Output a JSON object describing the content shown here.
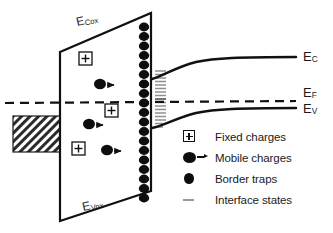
{
  "figure": {
    "kind": "mos-energy-band-diagram",
    "background": "#ffffff",
    "line_color": "#111111",
    "interface_state_color": "#8f8f8f"
  },
  "oxide": {
    "top_band_label": "E",
    "top_band_sub": "Cox",
    "bottom_band_label": "E",
    "bottom_band_sub": "Vox"
  },
  "semiconductor": {
    "conduction_label": "E",
    "conduction_sub": "C",
    "fermi_label": "E",
    "fermi_sub": "F",
    "valence_label": "E",
    "valence_sub": "V"
  },
  "charges": {
    "fixed": [
      {
        "x": 85,
        "y": 58
      },
      {
        "x": 111,
        "y": 110
      },
      {
        "x": 78,
        "y": 148
      }
    ],
    "mobile": [
      {
        "x": 100,
        "y": 84
      },
      {
        "x": 89,
        "y": 124
      },
      {
        "x": 107,
        "y": 150
      }
    ],
    "border_trap_count": 19
  },
  "legend": {
    "items": [
      {
        "icon": "boxed-plus-icon",
        "label": "Fixed charges"
      },
      {
        "icon": "mobile-charge-icon",
        "label": "Mobile charges"
      },
      {
        "icon": "border-trap-icon",
        "label": "Border traps"
      },
      {
        "icon": "interface-state-icon",
        "label": "Interface states"
      }
    ]
  }
}
